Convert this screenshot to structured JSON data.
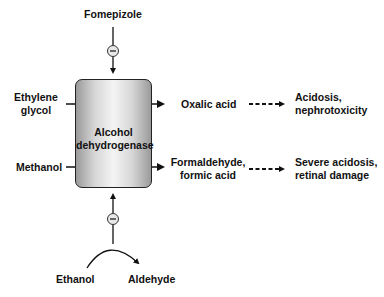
{
  "diagram": {
    "enzyme": "Alcohol\ndehydrogenase",
    "enzyme_line1": "Alcohol",
    "enzyme_line2": "dehydrogenase",
    "inhibitor_top": "Fomepizole",
    "substrate_1": {
      "line1": "Ethylene",
      "line2": "glycol"
    },
    "product_1": "Oxalic acid",
    "effect_1": {
      "line1": "Acidosis,",
      "line2": "nephrotoxicity"
    },
    "substrate_2": "Methanol",
    "product_2": {
      "line1": "Formaldehyde,",
      "line2": "formic acid"
    },
    "effect_2": {
      "line1": "Severe acidosis,",
      "line2": "retinal damage"
    },
    "competitor_substrate": "Ethanol",
    "competitor_product": "Aldehyde",
    "inhibition_symbol": "−"
  }
}
